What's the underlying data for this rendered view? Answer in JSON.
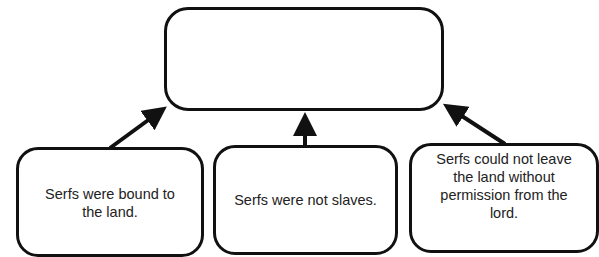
{
  "diagram": {
    "type": "concept-map",
    "top_box": {
      "text": ""
    },
    "supporting_boxes": [
      {
        "id": "left",
        "text": "Serfs were bound to the land."
      },
      {
        "id": "middle",
        "text": "Serfs were not slaves."
      },
      {
        "id": "right",
        "text": "Serfs could not leave the land without permission from the lord."
      }
    ],
    "arrows": [
      {
        "from": "left",
        "to": "top_box"
      },
      {
        "from": "middle",
        "to": "top_box"
      },
      {
        "from": "right",
        "to": "top_box"
      }
    ],
    "colors": {
      "stroke": "#111111",
      "text": "#222222",
      "background": "#ffffff"
    }
  }
}
